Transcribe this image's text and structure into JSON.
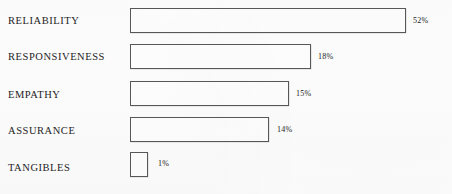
{
  "chart_data": {
    "type": "bar",
    "orientation": "horizontal",
    "title": "",
    "subtitle": "",
    "xlabel": "",
    "ylabel": "",
    "grid": false,
    "legend": false,
    "legend_position": "none",
    "axis_visible": false,
    "value_suffix": "%",
    "categories": [
      "RELIABILITY",
      "RESPONSIVENESS",
      "EMPATHY",
      "ASSURANCE",
      "TANGIBLES"
    ],
    "values": [
      52,
      18,
      15,
      14,
      1
    ],
    "value_labels": [
      "52%",
      "18%",
      "15%",
      "14%",
      "1%"
    ],
    "xlim": [
      0,
      52
    ],
    "bars": [
      {
        "category": "RELIABILITY",
        "value": 52,
        "value_label": "52%",
        "label_top": 16,
        "bar_left": 130,
        "bar_top": 8,
        "bar_width": 276,
        "bar_height": 25,
        "value_left": 413,
        "value_top": 17
      },
      {
        "category": "RESPONSIVENESS",
        "value": 18,
        "value_label": "18%",
        "label_top": 52,
        "bar_left": 130,
        "bar_top": 44,
        "bar_width": 181,
        "bar_height": 25,
        "value_left": 318,
        "value_top": 53
      },
      {
        "category": "EMPATHY",
        "value": 15,
        "value_label": "15%",
        "label_top": 90,
        "bar_left": 130,
        "bar_top": 81,
        "bar_width": 159,
        "bar_height": 25,
        "value_left": 296,
        "value_top": 90
      },
      {
        "category": "ASSURANCE",
        "value": 14,
        "value_label": "14%",
        "label_top": 126,
        "bar_left": 130,
        "bar_top": 117,
        "bar_width": 139,
        "bar_height": 25,
        "value_left": 277,
        "value_top": 126
      },
      {
        "category": "TANGIBLES",
        "value": 1,
        "value_label": "1%",
        "label_top": 163,
        "bar_left": 130,
        "bar_top": 152,
        "bar_width": 18,
        "bar_height": 25,
        "value_left": 158,
        "value_top": 160
      }
    ],
    "colors": {
      "background": "#fefefe",
      "bar_fill": "#ffffff",
      "bar_stroke": "#585858",
      "category_text": "#1d1d1d",
      "value_text": "#222222"
    }
  }
}
